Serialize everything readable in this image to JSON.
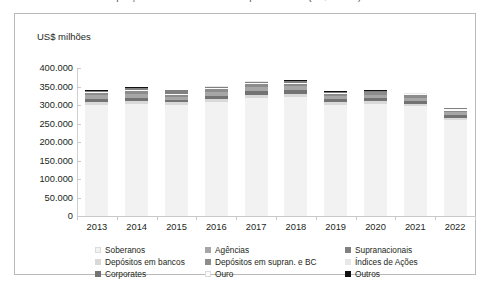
{
  "caption": {
    "text": "Gráfico — Composição das reservas internacionais por instrumento (US$ milhões)"
  },
  "axis_unit_label": "US$ milhões",
  "colors": {
    "soberanos": "#f2f2f2",
    "agencias": "#a6a6a6",
    "supranacionais": "#808080",
    "depositos_em_bancos": "#d9d9d9",
    "depositos_em_supran_e_bc": "#8c8c8c",
    "indices_de_acoes": "#e8e8e8",
    "corporates": "#737373",
    "ouro": "#fbfbfb",
    "outros": "#111111",
    "frame": "#b9b9b9",
    "axis": "#c9c9c9",
    "text": "#231f20"
  },
  "legend": {
    "items": [
      {
        "label": "Soberanos",
        "color_key": "soberanos",
        "col": 0,
        "row": 0
      },
      {
        "label": "Depósitos em bancos",
        "color_key": "depositos_em_bancos",
        "col": 0,
        "row": 1
      },
      {
        "label": "Corporates",
        "color_key": "corporates",
        "col": 0,
        "row": 2
      },
      {
        "label": "Agências",
        "color_key": "agencias",
        "col": 1,
        "row": 0
      },
      {
        "label": "Depósitos em supran. e BC",
        "color_key": "depositos_em_supran_e_bc",
        "col": 1,
        "row": 1
      },
      {
        "label": "Ouro",
        "color_key": "ouro",
        "col": 1,
        "row": 2
      },
      {
        "label": "Supranacionais",
        "color_key": "supranacionais",
        "col": 2,
        "row": 0
      },
      {
        "label": "Índices de Ações",
        "color_key": "indices_de_acoes",
        "col": 2,
        "row": 1
      },
      {
        "label": "Outros",
        "color_key": "outros",
        "col": 2,
        "row": 2
      }
    ]
  },
  "chart_data": {
    "type": "bar",
    "stacked": true,
    "title": "",
    "xlabel": "",
    "ylabel": "US$ milhões",
    "ylim": [
      0,
      400000
    ],
    "ytick_labels": [
      "400.000",
      "350.000",
      "300.000",
      "250.000",
      "200.000",
      "150.000",
      "100.000",
      "50.000",
      "0"
    ],
    "ytick_values": [
      400000,
      350000,
      300000,
      250000,
      200000,
      150000,
      100000,
      50000,
      0
    ],
    "grid": false,
    "legend_position": "bottom",
    "categories": [
      "2013",
      "2014",
      "2015",
      "2016",
      "2017",
      "2018",
      "2019",
      "2020",
      "2021",
      "2022"
    ],
    "series": [
      {
        "name": "Soberanos",
        "color_key": "soberanos",
        "values": [
          300000,
          303000,
          300000,
          308000,
          318000,
          322000,
          300000,
          303000,
          296000,
          259000
        ]
      },
      {
        "name": "Depósitos em bancos",
        "color_key": "depositos_em_bancos",
        "values": [
          9000,
          9000,
          8000,
          9000,
          10000,
          9000,
          8000,
          8000,
          8000,
          7000
        ]
      },
      {
        "name": "Corporates",
        "color_key": "corporates",
        "values": [
          8000,
          8000,
          6000,
          8000,
          10000,
          9000,
          7000,
          8000,
          7000,
          6000
        ]
      },
      {
        "name": "Agências",
        "color_key": "agencias",
        "values": [
          10000,
          11000,
          9000,
          11000,
          12000,
          11000,
          9000,
          9000,
          9000,
          8000
        ]
      },
      {
        "name": "Depósitos em supran. e BC",
        "color_key": "depositos_em_supran_e_bc",
        "values": [
          6000,
          7000,
          5000,
          7000,
          8000,
          7000,
          6000,
          6000,
          6000,
          5000
        ]
      },
      {
        "name": "Ouro",
        "color_key": "ouro",
        "values": [
          2000,
          2000,
          2000,
          2000,
          2000,
          2000,
          2000,
          2000,
          3000,
          3000
        ]
      },
      {
        "name": "Supranacionais",
        "color_key": "supranacionais",
        "values": [
          3000,
          6000,
          10000,
          5000,
          3000,
          4000,
          3000,
          2000,
          2000,
          3000
        ]
      },
      {
        "name": "Índices de Ações",
        "color_key": "indices_de_acoes",
        "values": [
          1000,
          1000,
          1000,
          1000,
          1000,
          2000,
          1000,
          1000,
          1000,
          1000
        ]
      },
      {
        "name": "Outros",
        "color_key": "outros",
        "values": [
          1000,
          1000,
          1000,
          1000,
          1000,
          1000,
          1000,
          1000,
          1000,
          1000
        ]
      }
    ],
    "totals": [
      340000,
      348000,
      342000,
      352000,
      365000,
      367000,
      337000,
      340000,
      333000,
      292000
    ]
  }
}
